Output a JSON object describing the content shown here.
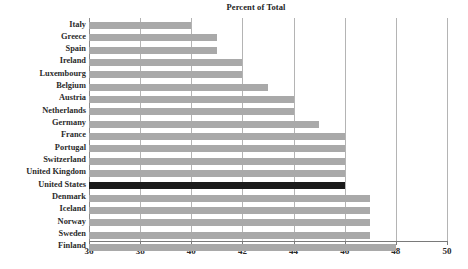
{
  "chart_data": {
    "type": "bar",
    "orientation": "horizontal",
    "title": "Percent of Total",
    "clipped_title_ghost": "",
    "xlabel": "",
    "ylabel": "",
    "xlim": [
      36,
      50
    ],
    "xticks": [
      36,
      38,
      40,
      42,
      44,
      46,
      48,
      50
    ],
    "xtick_labels": [
      "36",
      "38",
      "40",
      "42",
      "44",
      "46",
      "48",
      "50"
    ],
    "grid": true,
    "grid_axis": "x",
    "legend": null,
    "bar_color": "#a9a9a9",
    "highlight_color": "#1a1a1a",
    "highlight_category": "United States",
    "categories": [
      "Italy",
      "Greece",
      "Spain",
      "Ireland",
      "Luxembourg",
      "Belgium",
      "Austria",
      "Netherlands",
      "Germany",
      "France",
      "Portugal",
      "Switzerland",
      "United Kingdom",
      "United States",
      "Denmark",
      "Iceland",
      "Norway",
      "Sweden",
      "Finland"
    ],
    "values": [
      40,
      41,
      41,
      42,
      42,
      43,
      44,
      44,
      45,
      46,
      46,
      46,
      46,
      46,
      47,
      47,
      47,
      47,
      48
    ]
  }
}
